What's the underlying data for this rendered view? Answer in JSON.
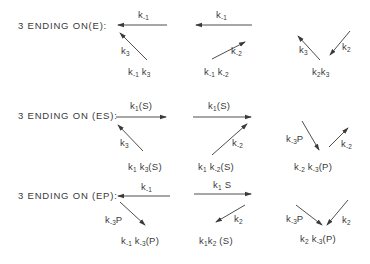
{
  "diagram": {
    "arrow_color": "#3a3a3a",
    "rows": [
      {
        "id": "E",
        "label": "3 ENDING ON(E):",
        "columns": [
          {
            "top_rate": "k-1",
            "top_direction": "left",
            "diag_rate": "k3",
            "diag_direction": "up-left",
            "product": "k-1 k3"
          },
          {
            "top_rate": "k-1",
            "top_direction": "left",
            "diag_rate": "k-2",
            "diag_direction": "up-right",
            "product": "k-1 k-2"
          },
          {
            "left_rate": "k3",
            "left_direction": "up-left",
            "right_rate": "k2",
            "right_direction": "down-left",
            "product": "k2k3"
          }
        ]
      },
      {
        "id": "ES",
        "label": "3 ENDING ON (ES):",
        "columns": [
          {
            "top_rate": "k1(S)",
            "top_direction": "right",
            "diag_rate": "k3",
            "diag_direction": "up-left",
            "product": "k1k3(S)"
          },
          {
            "top_rate": "k1(S)",
            "top_direction": "right",
            "diag_rate": "k-2",
            "diag_direction": "up-right",
            "product": "k1 k-2(S)"
          },
          {
            "left_rate": "k-3P",
            "left_direction": "down-right",
            "right_rate": "k-2",
            "right_direction": "up-right",
            "product": "k-2 k-3(P)"
          }
        ]
      },
      {
        "id": "EP",
        "label": "3 ENDING ON (EP):",
        "columns": [
          {
            "top_rate": "k-1",
            "top_direction": "left",
            "diag_rate": "k-3P",
            "diag_direction": "down-right",
            "product": "k-1 k-3(P)"
          },
          {
            "top_rate": "k1 S",
            "top_direction": "right",
            "diag_rate": "k2",
            "diag_direction": "down-left",
            "product": "k1k2 (S)"
          },
          {
            "left_rate": "k-3P",
            "left_direction": "down-right",
            "right_rate": "k2",
            "right_direction": "down-left",
            "product": "k2 k-3(P)"
          }
        ]
      }
    ]
  },
  "labels": {
    "row_e": "3 ENDING ON(E):",
    "row_es": "3 ENDING ON (ES):",
    "row_ep": "3 ENDING ON (EP):",
    "k": "k",
    "sub_m1": "-1",
    "sub_1": "1",
    "sub_2": "2",
    "sub_m2": "-2",
    "sub_3": "3",
    "sub_m3": "-3",
    "S": "S",
    "P": "P",
    "paren_S": "(S)",
    "paren_P": "(P)"
  }
}
